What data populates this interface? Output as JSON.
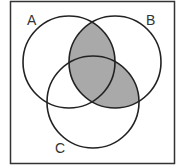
{
  "diagram": {
    "type": "venn",
    "sets": [
      {
        "label": "A",
        "cx": 69,
        "cy": 62,
        "r": 46
      },
      {
        "label": "B",
        "cx": 115,
        "cy": 62,
        "r": 46
      },
      {
        "label": "C",
        "cx": 93,
        "cy": 102,
        "r": 46
      }
    ],
    "shaded_region": "B ∩ (A ∪ C)",
    "colors": {
      "shade": "#a9a9a9",
      "stroke": "#222222",
      "background": "#ffffff"
    }
  }
}
